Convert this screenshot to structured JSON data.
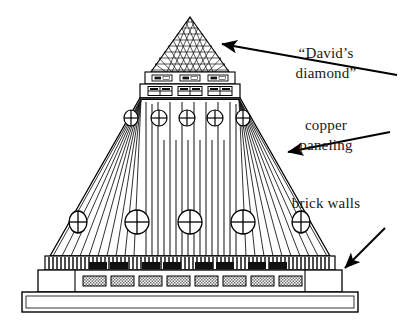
{
  "figure": {
    "background_color": "#ffffff",
    "ink_color": "#000000"
  },
  "annotations": [
    {
      "id": "davids-diamond",
      "lines": [
        "“David’s",
        "diamond”"
      ],
      "line1": "“David’s",
      "line2": "diamond”",
      "text_x": 326,
      "text_y": 58,
      "arrow": {
        "x1": 397,
        "y1": 75,
        "x2": 222,
        "y2": 44,
        "direction": "up-left"
      }
    },
    {
      "id": "copper-paneling",
      "lines": [
        "copper",
        "paneling"
      ],
      "line1": "copper",
      "line2": "paneling",
      "text_x": 326,
      "text_y": 130,
      "arrow": {
        "x1": 390,
        "y1": 132,
        "x2": 288,
        "y2": 152,
        "direction": "down-left"
      }
    },
    {
      "id": "brick-walls",
      "lines": [
        "brick walls"
      ],
      "line1": "brick walls",
      "text_x": 326,
      "text_y": 208,
      "arrow": {
        "x1": 385,
        "y1": 230,
        "x2": 345,
        "y2": 270,
        "direction": "down-left"
      }
    }
  ],
  "building": {
    "parts": [
      {
        "name": "diamond-lattice-apex",
        "label": "David's diamond lattice roof",
        "lattice_rows": 8
      },
      {
        "name": "clerestory-upper-band",
        "label": "upper window band",
        "window_count": 3
      },
      {
        "name": "clerestory-lower-band",
        "label": "lower window band",
        "window_count": 3
      },
      {
        "name": "copper-paneling-fan",
        "label": "fanned copper panel lines"
      },
      {
        "name": "roundel-row-upper",
        "label": "upper circular windows",
        "count": 5
      },
      {
        "name": "roundel-row-lower",
        "label": "lower circular windows",
        "count": 5
      },
      {
        "name": "pilaster-stripe-band",
        "label": "vertical pilaster striping"
      },
      {
        "name": "brick-podium",
        "label": "brick wall podium",
        "window_count": 8
      },
      {
        "name": "base-plinth",
        "label": "base plinth"
      }
    ],
    "apex_x": 190,
    "apex_y": 17,
    "dark_window_count": 8,
    "brick_window_count": 8,
    "roundel_upper_count": 5,
    "roundel_lower_count": 5
  }
}
